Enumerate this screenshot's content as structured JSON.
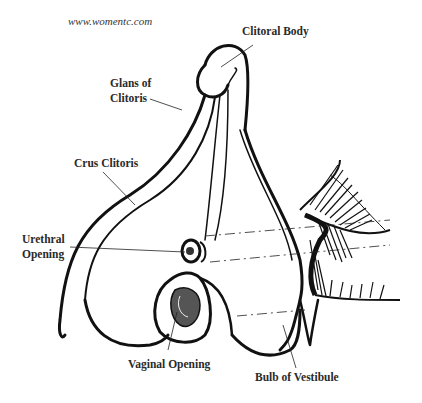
{
  "watermark": "www.womentc.com",
  "diagram": {
    "labels": {
      "clitoral_body": "Clitoral Body",
      "glans_line1": "Glans of",
      "glans_line2": "Clitoris",
      "crus": "Crus Clitoris",
      "urethral_line1": "Urethral",
      "urethral_line2": "Opening",
      "vaginal": "Vaginal Opening",
      "bulb": "Bulb of Vestibule"
    }
  }
}
